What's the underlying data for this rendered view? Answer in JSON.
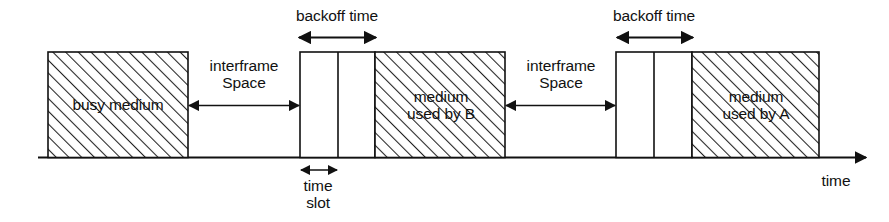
{
  "figure": {
    "type": "timing-diagram",
    "title": "",
    "axis": {
      "label": "time",
      "direction": "left-to-right",
      "baseline_y": 157,
      "start_x": 38,
      "end_x": 872
    },
    "colors": {
      "line": "#111111",
      "hatch": "#222222",
      "background": "#ffffff"
    },
    "segments": [
      {
        "id": "busy-medium",
        "label": "busy medium",
        "kind": "hatched-block",
        "x": 48,
        "width": 140
      },
      {
        "id": "interframe-space-1",
        "label_line1": "interframe",
        "label_line2": "Space",
        "kind": "double-arrow-span",
        "x": 188,
        "width": 112
      },
      {
        "id": "backoff-slots-1",
        "kind": "slot-boxes",
        "label": "backoff time",
        "x": 300,
        "width": 75,
        "slots": 2,
        "divider_x": 338
      },
      {
        "id": "time-slot-1",
        "label_line1": "time",
        "label_line2": "slot",
        "kind": "double-arrow-span",
        "x": 300,
        "width": 38
      },
      {
        "id": "medium-used-by-b",
        "label_line1": "medium",
        "label_line2": "used by B",
        "kind": "hatched-block",
        "x": 375,
        "width": 130
      },
      {
        "id": "interframe-space-2",
        "label_line1": "interframe",
        "label_line2": "Space",
        "kind": "double-arrow-span",
        "x": 505,
        "width": 111
      },
      {
        "id": "backoff-slots-2",
        "kind": "slot-boxes",
        "label": "backoff time",
        "x": 616,
        "width": 76,
        "slots": 2,
        "divider_x": 654
      },
      {
        "id": "medium-used-by-a",
        "label_line1": "medium",
        "label_line2": "used by A",
        "kind": "hatched-block",
        "x": 692,
        "width": 127
      }
    ],
    "labels": {
      "busy_medium": "busy medium",
      "interframe_1_line1": "interframe",
      "interframe_1_line2": "Space",
      "interframe_2_line1": "interframe",
      "interframe_2_line2": "Space",
      "backoff_time_1": "backoff time",
      "backoff_time_2": "backoff time",
      "time_slot_line1": "time",
      "time_slot_line2": "slot",
      "medium_b_line1": "medium",
      "medium_b_line2": "used by B",
      "medium_a_line1": "medium",
      "medium_a_line2": "used by A",
      "axis_time": "time"
    }
  }
}
